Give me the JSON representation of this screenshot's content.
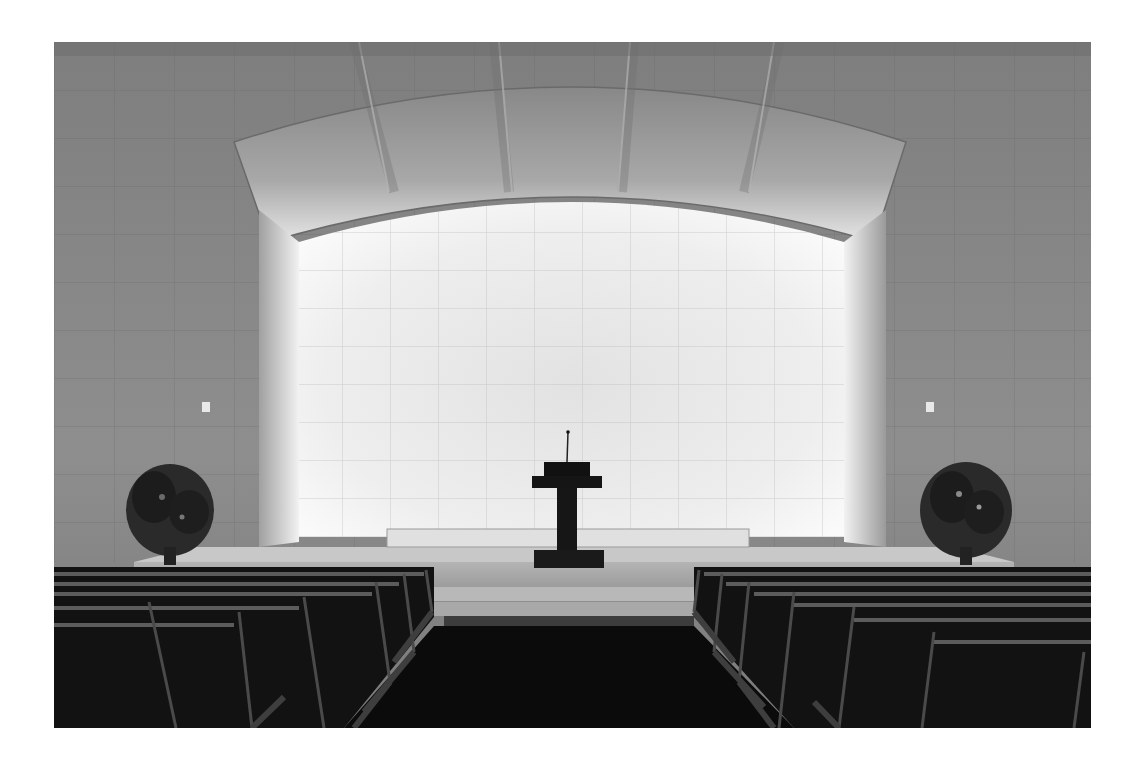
{
  "image": {
    "alt": "Black and white photograph of a minimalist chapel interior: stone-tiled wall with a backlit arched alcove, central lectern on a raised platform, flower arrangements on each side, and rows of wooden pews flanking a dark center aisle",
    "subject": "chapel interior",
    "colors": {
      "border": "#ffffff",
      "wall": "#8c8c8c",
      "alcove_glow": "#f4f4f4",
      "pews": "#141414",
      "aisle": "#0a0a0a"
    }
  }
}
